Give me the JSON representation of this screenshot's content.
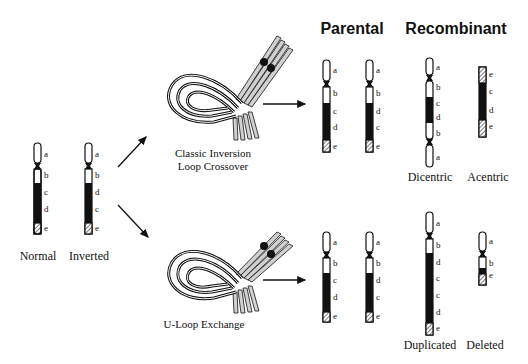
{
  "headers": {
    "parental": "Parental",
    "recombinant": "Recombinant"
  },
  "left": {
    "normal_label": "Normal",
    "inverted_label": "Inverted",
    "normal_genes": [
      "a",
      "b",
      "c",
      "d",
      "e"
    ],
    "inverted_genes": [
      "a",
      "b",
      "d",
      "c",
      "e"
    ]
  },
  "pathways": [
    {
      "name": "classic",
      "label_line1": "Classic Inversion",
      "label_line2": "Loop Crossover",
      "parental": [
        {
          "genes": [
            "a",
            "b",
            "c",
            "d",
            "e"
          ]
        },
        {
          "genes": [
            "a",
            "b",
            "d",
            "c",
            "e"
          ]
        }
      ],
      "recombinant": [
        {
          "label": "Dicentric",
          "genes": [
            "a",
            "b",
            "c",
            "d",
            "b",
            "a"
          ]
        },
        {
          "label": "Acentric",
          "genes": [
            "e",
            "c",
            "d",
            "e"
          ]
        }
      ]
    },
    {
      "name": "u-loop",
      "label_line1": "U-Loop Exchange",
      "parental": [
        {
          "genes": [
            "a",
            "b",
            "c",
            "d",
            "e"
          ]
        },
        {
          "genes": [
            "a",
            "b",
            "d",
            "c",
            "e"
          ]
        }
      ],
      "recombinant": [
        {
          "label": "Duplicated",
          "genes": [
            "a",
            "b",
            "d",
            "c",
            "c",
            "d",
            "e"
          ]
        },
        {
          "label": "Deleted",
          "genes": [
            "a",
            "b",
            "e"
          ]
        }
      ]
    }
  ],
  "colors": {
    "ink": "#111111",
    "paper": "#ffffff",
    "hatch": "#9a9a9a",
    "strand_gray": "#bdbdbd"
  }
}
